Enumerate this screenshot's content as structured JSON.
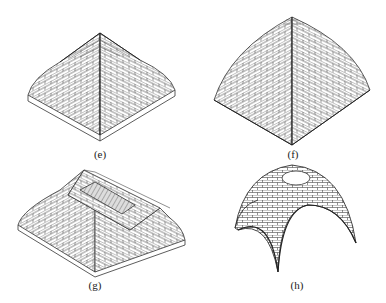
{
  "figures": [
    {
      "id": "e",
      "label": "(e)",
      "description": "Square-based vault with pyramidal cap (brick courses)"
    },
    {
      "id": "f",
      "label": "(f)",
      "description": "Cloister / domical vault, curved faces (brick courses)"
    },
    {
      "id": "g",
      "label": "(g)",
      "description": "Rectangular cloister vault with opening at crown"
    },
    {
      "id": "h",
      "label": "(h)",
      "description": "Sail / pendentive dome on four arches with oculus"
    }
  ],
  "colors": {
    "line": "#333333",
    "background": "#ffffff"
  }
}
